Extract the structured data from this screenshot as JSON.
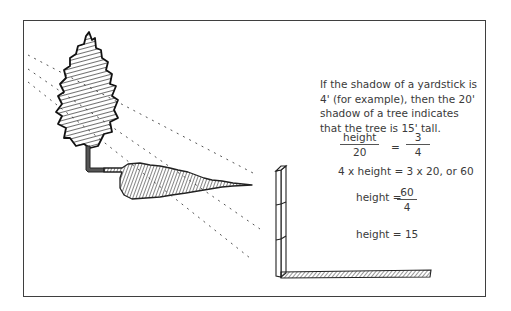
{
  "explanation": {
    "paragraph": "If the shadow of a yardstick is 4' (for example), then the 20' shadow of a tree indicates that the tree is 15' tall."
  },
  "equations": {
    "eq1": {
      "left_num": "height",
      "left_den": "20",
      "equals": "=",
      "right_num": "3",
      "right_den": "4"
    },
    "eq2": "4 x height = 3 x 20, or 60",
    "eq3": {
      "label": "height =",
      "num": "60",
      "den": "4"
    },
    "eq4": "height = 15"
  },
  "illustration": {
    "objects": [
      "tree-icon",
      "tree-shadow",
      "sun-ray-lines",
      "yardstick-icon",
      "yardstick-shadow"
    ],
    "colors": {
      "ink": "#3a3a3a",
      "frame": "#3f3f3f",
      "background": "#ffffff"
    }
  }
}
